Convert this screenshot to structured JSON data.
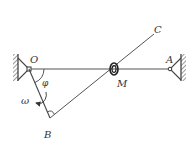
{
  "diagram": {
    "type": "mechanism",
    "colors": {
      "line": "#444444",
      "hatch": "#555555",
      "label": "#333333",
      "background": "#ffffff"
    },
    "labels": {
      "O": "O",
      "A": "A",
      "C": "C",
      "M": "M",
      "B": "B",
      "phi": "φ",
      "omega": "ω"
    },
    "points": {
      "O": [
        29,
        69
      ],
      "A": [
        170,
        69
      ],
      "B": [
        50,
        118
      ],
      "C": [
        154,
        34
      ],
      "M": [
        114,
        69
      ]
    },
    "elements": [
      "fixed support at O (left wall)",
      "fixed support at A (right wall)",
      "horizontal rod OA",
      "crank OB rotating with angular velocity ω",
      "rod BC at right angle to OB",
      "ring M sliding on OA and BC",
      "angle φ between OA and OB"
    ]
  }
}
